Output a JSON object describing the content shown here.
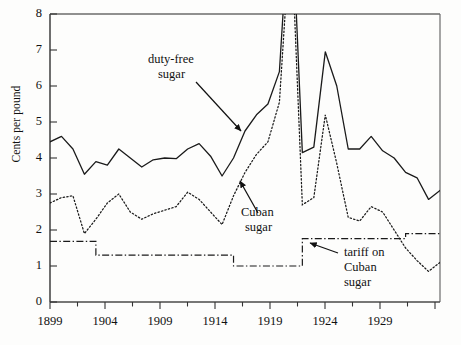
{
  "figure": {
    "background": "#fdfdfc",
    "ink": "#1a1a1a"
  },
  "axis": {
    "y_title": "Cents per pound",
    "y_ticks": [
      "0",
      "1",
      "2",
      "3",
      "4",
      "5",
      "6",
      "7",
      "8"
    ],
    "x_ticks": [
      "1899",
      "1904",
      "1909",
      "1914",
      "1919",
      "1924",
      "1929"
    ]
  },
  "annotations": [
    {
      "name": "duty-free-sugar",
      "line1": "duty-free",
      "line2": "sugar"
    },
    {
      "name": "cuban-sugar",
      "line1": "Cuban",
      "line2": "sugar"
    },
    {
      "name": "tariff-on-cuban-sugar",
      "line1": "tariff on",
      "line2": "Cuban",
      "line3": "sugar"
    }
  ],
  "chart_data": {
    "type": "line",
    "title": "",
    "xlabel": "",
    "ylabel": "Cents per pound",
    "xlim": [
      1899,
      1933
    ],
    "ylim": [
      0,
      8
    ],
    "grid": false,
    "legend": "annotations-with-arrows",
    "x": [
      1899,
      1900,
      1901,
      1902,
      1903,
      1904,
      1905,
      1906,
      1907,
      1908,
      1909,
      1910,
      1911,
      1912,
      1913,
      1914,
      1915,
      1916,
      1917,
      1918,
      1919,
      1920,
      1921,
      1922,
      1923,
      1924,
      1925,
      1926,
      1927,
      1928,
      1929,
      1930,
      1931,
      1932,
      1933
    ],
    "series": [
      {
        "name": "duty-free sugar",
        "style": "solid",
        "note": "1920 value rises off the top of the axis (clipped above 8)",
        "values": [
          4.45,
          4.6,
          4.25,
          3.55,
          3.9,
          3.8,
          4.25,
          4.0,
          3.75,
          3.95,
          4.0,
          3.98,
          4.25,
          4.4,
          4.05,
          3.5,
          4.0,
          4.75,
          5.2,
          5.5,
          6.4,
          11.5,
          4.15,
          4.3,
          6.95,
          6.0,
          4.25,
          4.25,
          4.6,
          4.2,
          4.0,
          3.6,
          3.45,
          2.85,
          3.1
        ]
      },
      {
        "name": "Cuban sugar",
        "style": "dotted",
        "note": "1920 value rises off the top of the axis (clipped above 8)",
        "values": [
          2.75,
          2.9,
          2.95,
          1.9,
          2.3,
          2.75,
          3.0,
          2.5,
          2.3,
          2.45,
          2.55,
          2.65,
          3.05,
          2.85,
          2.5,
          2.15,
          2.95,
          3.6,
          4.1,
          4.45,
          5.55,
          10.5,
          2.7,
          2.9,
          5.2,
          3.85,
          2.35,
          2.25,
          2.65,
          2.5,
          2.0,
          1.5,
          1.15,
          0.85,
          1.1
        ]
      },
      {
        "name": "tariff on Cuban sugar",
        "style": "dash-dot",
        "note": "step function",
        "values": [
          1.685,
          1.685,
          1.685,
          1.685,
          1.3,
          1.3,
          1.3,
          1.3,
          1.3,
          1.3,
          1.3,
          1.3,
          1.3,
          1.3,
          1.3,
          1.3,
          1.0,
          1.0,
          1.0,
          1.0,
          1.0,
          1.0,
          1.76,
          1.76,
          1.76,
          1.76,
          1.76,
          1.76,
          1.76,
          1.76,
          1.76,
          1.9,
          1.9,
          1.9,
          1.9
        ]
      }
    ]
  }
}
